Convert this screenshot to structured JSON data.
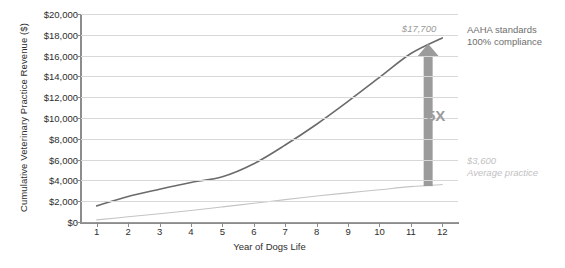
{
  "chart_data": {
    "type": "line",
    "title": "",
    "xlabel": "Year of Dogs Life",
    "ylabel": "Cumulative Veterinary Practice Revenue ($)",
    "x": [
      1,
      2,
      3,
      4,
      5,
      6,
      7,
      8,
      9,
      10,
      11,
      12
    ],
    "xtick_labels": [
      "1",
      "2",
      "3",
      "4",
      "5",
      "6",
      "7",
      "8",
      "9",
      "10",
      "11",
      "12"
    ],
    "xlim": [
      0.5,
      12.5
    ],
    "ylim": [
      0,
      20000
    ],
    "ytick_values": [
      0,
      2000,
      4000,
      6000,
      8000,
      10000,
      12000,
      14000,
      16000,
      18000,
      20000
    ],
    "ytick_labels": [
      "$0",
      "$2,000",
      "$4,000",
      "$6,000",
      "$8,000",
      "$10,000",
      "$12,000",
      "$14,000",
      "$16,000",
      "$18,000",
      "$20,000"
    ],
    "grid": true,
    "legend": "none",
    "series": [
      {
        "name": "AAHA standards 100% compliance",
        "color": "#6b6b6b",
        "values": [
          1550,
          2450,
          3150,
          3800,
          4350,
          5600,
          7400,
          9400,
          11600,
          13900,
          16200,
          17700
        ]
      },
      {
        "name": "Average practice",
        "color": "#c4c4c4",
        "values": [
          200,
          500,
          800,
          1100,
          1450,
          1800,
          2150,
          2500,
          2800,
          3100,
          3400,
          3600
        ]
      }
    ],
    "annotations": [
      {
        "name": "top-value-callout",
        "text": "$17,700",
        "x": 11.35,
        "y": 18600
      },
      {
        "name": "multiplier",
        "text": "5X",
        "x": 12.15,
        "y": 10200
      },
      {
        "name": "arrow",
        "type": "double-ended-up-arrow",
        "x": 11.55,
        "y_start": 3450,
        "y_end": 17150,
        "color": "#9b9b9b"
      }
    ]
  },
  "side_notes": {
    "top": {
      "line1": "AAHA standards",
      "line2": "100% compliance"
    },
    "bottom": {
      "line1": "$3,600",
      "line2": "Average practice"
    }
  },
  "colors": {
    "primary_series": "#6b6b6b",
    "secondary_series": "#c4c4c4",
    "arrow": "#9b9b9b",
    "grid": "#d8d8d8",
    "axis": "#8c8c8c",
    "text": "#2e2e2e",
    "muted_text": "#c2c2c2"
  }
}
